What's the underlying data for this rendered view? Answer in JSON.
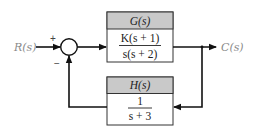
{
  "diagram": {
    "type": "block-diagram",
    "input_label": "R(s)",
    "output_label": "C(s)",
    "summing_junction": {
      "plus_sign": "+",
      "minus_sign": "−"
    },
    "forward_block": {
      "title": "G(s)",
      "numerator": "K(s + 1)",
      "denominator": "s(s + 2)"
    },
    "feedback_block": {
      "title": "H(s)",
      "numerator": "1",
      "denominator": "s + 3"
    },
    "colors": {
      "line": "#111111",
      "header_fill": "#c9c9c9",
      "box_border": "#333333",
      "label_text": "#8a8a8a"
    }
  }
}
